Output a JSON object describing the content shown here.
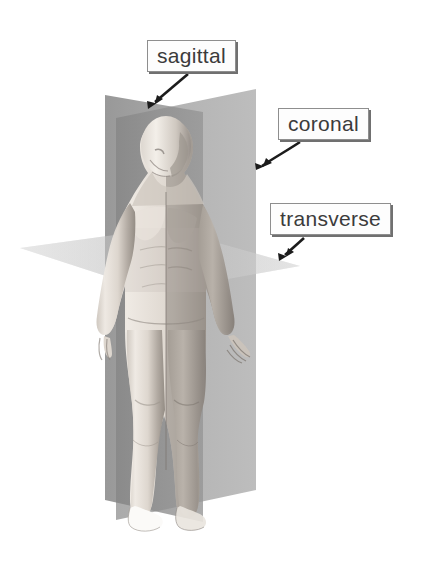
{
  "figure": {
    "background_color": "#ffffff",
    "width": 438,
    "height": 562
  },
  "labels": [
    {
      "id": "sagittal",
      "text": "sagittal",
      "box": {
        "x": 147,
        "y": 40,
        "width": 133,
        "height": 33
      },
      "arrow": {
        "from_x": 185,
        "from_y": 76,
        "to_x": 150,
        "to_y": 107
      }
    },
    {
      "id": "coronal",
      "text": "coronal",
      "box": {
        "x": 278,
        "y": 108,
        "width": 126,
        "height": 33
      },
      "arrow": {
        "from_x": 295,
        "from_y": 144,
        "to_x": 259,
        "to_y": 168
      }
    },
    {
      "id": "transverse",
      "text": "transverse",
      "box": {
        "x": 270,
        "y": 203,
        "width": 143,
        "height": 33
      },
      "arrow": {
        "from_x": 305,
        "from_y": 239,
        "to_x": 281,
        "to_y": 260
      }
    }
  ],
  "planes": [
    {
      "id": "sagittal-plane",
      "name": "sagittal plane",
      "orientation": "vertical-midline",
      "color": "#8a8a8a",
      "opacity": 0.78
    },
    {
      "id": "coronal-plane",
      "name": "coronal plane",
      "orientation": "vertical-frontal",
      "color": "#9a9a9a",
      "opacity": 0.72
    },
    {
      "id": "transverse-plane",
      "name": "transverse plane",
      "orientation": "horizontal",
      "color": "#d8d8d8",
      "opacity": 0.85
    }
  ],
  "colors": {
    "label_border": "#8e8e8e",
    "label_shadow": "#707070",
    "label_text": "#3b3b3b",
    "label_fill": "#fdfdfd",
    "arrow": "#1c1c1c",
    "skin_light": "#efeae4",
    "skin_mid": "#c9c2ba",
    "skin_shadow": "#8f8880"
  }
}
